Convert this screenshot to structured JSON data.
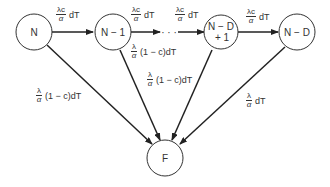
{
  "diagram": {
    "nodes": [
      {
        "id": "N",
        "label": "N"
      },
      {
        "id": "N-1",
        "label": "N − 1"
      },
      {
        "id": "N-D+1",
        "label_line1": "N − D",
        "label_line2": "+ 1"
      },
      {
        "id": "N-D",
        "label": "N − D"
      },
      {
        "id": "F",
        "label": "F"
      }
    ],
    "ellipsis": "· · ·",
    "edges": {
      "n_to_n1": {
        "num": "λc",
        "den": "α",
        "tail": "dT"
      },
      "n1_to_dots": {
        "num": "λc",
        "den": "α",
        "tail": "dT"
      },
      "dots_to_nd1": {
        "num": "λc",
        "den": "α",
        "tail": "dT"
      },
      "nd1_to_nd": {
        "num": "λc",
        "den": "α",
        "tail": "dT"
      },
      "n_to_f": {
        "num": "λ",
        "den": "α",
        "tail": "(1 − c)dT"
      },
      "n1_to_f_upper": {
        "num": "λ",
        "den": "α",
        "tail": "(1 − c)dT"
      },
      "nd1_to_f": {
        "num": "λ",
        "den": "α",
        "tail": "(1 − c)dT"
      },
      "nd_to_f": {
        "num": "λ",
        "den": "α",
        "tail": "dT"
      }
    }
  }
}
